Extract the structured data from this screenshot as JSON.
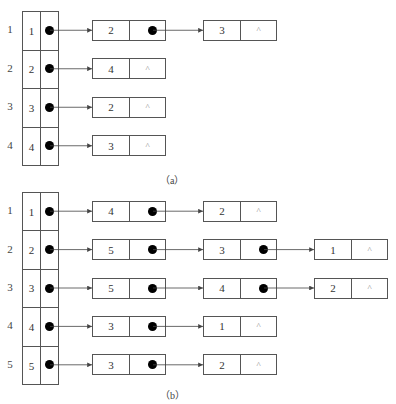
{
  "diagram_a": {
    "caption": "（a）",
    "rows": [
      {
        "index": "1",
        "vertex": "1",
        "chain": [
          {
            "value": "2",
            "next": "pointer"
          },
          {
            "value": "3",
            "next": "^"
          }
        ]
      },
      {
        "index": "2",
        "vertex": "2",
        "chain": [
          {
            "value": "4",
            "next": "^"
          }
        ]
      },
      {
        "index": "3",
        "vertex": "3",
        "chain": [
          {
            "value": "2",
            "next": "^"
          }
        ]
      },
      {
        "index": "4",
        "vertex": "4",
        "chain": [
          {
            "value": "3",
            "next": "^"
          }
        ]
      }
    ]
  },
  "diagram_b": {
    "caption": "（b）",
    "rows": [
      {
        "index": "1",
        "vertex": "1",
        "chain": [
          {
            "value": "4",
            "next": "pointer"
          },
          {
            "value": "2",
            "next": "^"
          }
        ]
      },
      {
        "index": "2",
        "vertex": "2",
        "chain": [
          {
            "value": "5",
            "next": "pointer"
          },
          {
            "value": "3",
            "next": "pointer"
          },
          {
            "value": "1",
            "next": "^"
          }
        ]
      },
      {
        "index": "3",
        "vertex": "3",
        "chain": [
          {
            "value": "5",
            "next": "pointer"
          },
          {
            "value": "4",
            "next": "pointer"
          },
          {
            "value": "2",
            "next": "^"
          }
        ]
      },
      {
        "index": "4",
        "vertex": "4",
        "chain": [
          {
            "value": "3",
            "next": "pointer"
          },
          {
            "value": "1",
            "next": "^"
          }
        ]
      },
      {
        "index": "5",
        "vertex": "5",
        "chain": [
          {
            "value": "3",
            "next": "pointer"
          },
          {
            "value": "2",
            "next": "^"
          }
        ]
      }
    ]
  },
  "null_symbol": "^"
}
